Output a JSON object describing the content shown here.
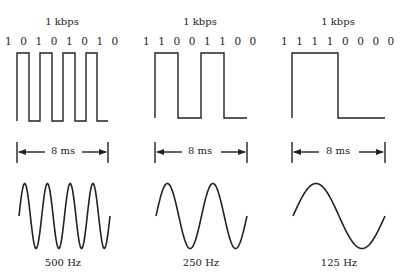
{
  "panels": [
    {
      "rate_label": "1 kbps",
      "bits": "1 0 1 0 1 0 1 0",
      "bit_sequence": [
        1,
        0,
        1,
        0,
        1,
        0,
        1,
        0
      ],
      "duration_label": "8 ms",
      "frequency_label": "500 Hz",
      "sine_cycles": 4
    },
    {
      "rate_label": "1 kbps",
      "bits": "1 1 0 0 1 1 0 0",
      "bit_sequence": [
        1,
        1,
        0,
        0,
        1,
        1,
        0,
        0
      ],
      "duration_label": "8 ms",
      "frequency_label": "250 Hz",
      "sine_cycles": 2
    },
    {
      "rate_label": "1 kbps",
      "bits": "1 1 1 1 0 0 0 0",
      "bit_sequence": [
        1,
        1,
        1,
        1,
        0,
        0,
        0,
        0
      ],
      "duration_label": "8 ms",
      "frequency_label": "125 Hz",
      "sine_cycles": 1
    }
  ],
  "colors": {
    "stroke": "#222222",
    "background": "#ffffff"
  }
}
